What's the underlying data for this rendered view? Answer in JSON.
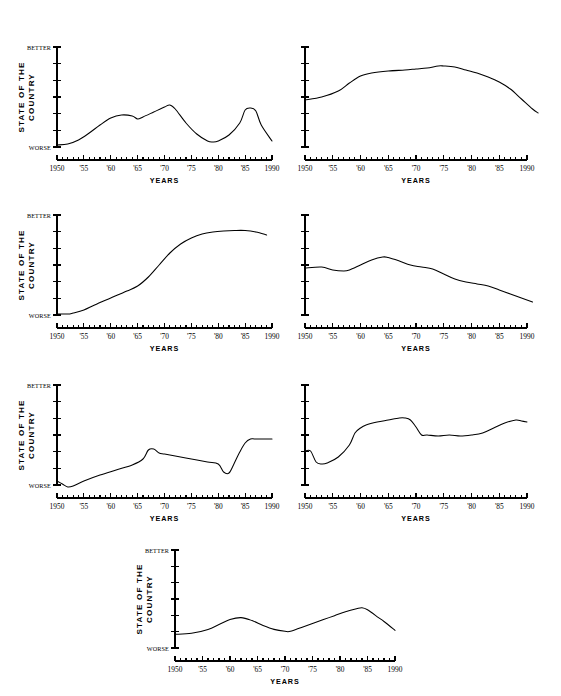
{
  "figure": {
    "background": "#ffffff",
    "ink": "#000000",
    "panel_count": 7
  },
  "axis_defaults": {
    "y_top_label": "BETTER",
    "y_bottom_label": "WORSE",
    "y_title_line1": "STATE OF THE",
    "y_title_line2": "COUNTRY",
    "x_title": "YEARS",
    "x_tick_labels": [
      "1950",
      "'55",
      "'60",
      "'65",
      "'70",
      "'75",
      "'80",
      "'85",
      "1990"
    ],
    "x_tick_values": [
      1950,
      1955,
      1960,
      1965,
      1970,
      1975,
      1980,
      1985,
      1990
    ],
    "x_minor_step": 1,
    "y_tick_count": 7
  },
  "chart_data": [
    {
      "id": "panel-1",
      "type": "line",
      "title": "",
      "xlabel": "YEARS",
      "ylabel": "STATE OF THE COUNTRY",
      "xlim": [
        1950,
        1990
      ],
      "ylim": [
        0,
        1
      ],
      "y_axis_labels": [
        "WORSE",
        "BETTER"
      ],
      "show_y_text": true,
      "grid": false,
      "legend": "none",
      "x": [
        1950,
        1952,
        1954,
        1956,
        1958,
        1960,
        1962,
        1964,
        1965,
        1966,
        1968,
        1970,
        1971,
        1972,
        1974,
        1976,
        1978,
        1979,
        1980,
        1982,
        1984,
        1985,
        1986,
        1987,
        1988,
        1990
      ],
      "y": [
        0.02,
        0.03,
        0.07,
        0.14,
        0.22,
        0.29,
        0.32,
        0.31,
        0.28,
        0.3,
        0.35,
        0.4,
        0.42,
        0.38,
        0.24,
        0.13,
        0.06,
        0.05,
        0.06,
        0.12,
        0.24,
        0.37,
        0.39,
        0.36,
        0.22,
        0.06
      ]
    },
    {
      "id": "panel-2",
      "type": "line",
      "title": "",
      "xlabel": "YEARS",
      "ylabel": "",
      "xlim": [
        1950,
        1992
      ],
      "ylim": [
        0,
        1
      ],
      "y_axis_labels": [],
      "show_y_text": false,
      "grid": false,
      "legend": "none",
      "x": [
        1950,
        1953,
        1956,
        1958,
        1960,
        1962,
        1965,
        1968,
        1970,
        1972,
        1974,
        1975,
        1977,
        1979,
        1981,
        1983,
        1985,
        1987,
        1989,
        1991,
        1992
      ],
      "y": [
        0.47,
        0.5,
        0.56,
        0.64,
        0.71,
        0.74,
        0.76,
        0.77,
        0.78,
        0.79,
        0.81,
        0.81,
        0.8,
        0.77,
        0.74,
        0.7,
        0.65,
        0.58,
        0.48,
        0.38,
        0.34
      ]
    },
    {
      "id": "panel-3",
      "type": "line",
      "title": "",
      "xlabel": "YEARS",
      "ylabel": "STATE OF THE COUNTRY",
      "xlim": [
        1950,
        1989
      ],
      "ylim": [
        0,
        1
      ],
      "y_axis_labels": [
        "WORSE",
        "BETTER"
      ],
      "show_y_text": true,
      "grid": false,
      "legend": "none",
      "x": [
        1950,
        1952,
        1953,
        1955,
        1957,
        1960,
        1963,
        1965,
        1967,
        1969,
        1971,
        1973,
        1975,
        1977,
        1979,
        1981,
        1983,
        1985,
        1987,
        1989
      ],
      "y": [
        0.01,
        0.01,
        0.02,
        0.05,
        0.1,
        0.17,
        0.24,
        0.29,
        0.38,
        0.5,
        0.62,
        0.71,
        0.77,
        0.81,
        0.83,
        0.84,
        0.845,
        0.845,
        0.83,
        0.8
      ]
    },
    {
      "id": "panel-4",
      "type": "line",
      "title": "",
      "xlabel": "YEARS",
      "ylabel": "",
      "xlim": [
        1950,
        1991
      ],
      "ylim": [
        0,
        1
      ],
      "y_axis_labels": [],
      "show_y_text": false,
      "grid": false,
      "legend": "none",
      "x": [
        1950,
        1953,
        1955,
        1957,
        1958,
        1960,
        1962,
        1964,
        1965,
        1967,
        1969,
        1971,
        1973,
        1975,
        1977,
        1979,
        1981,
        1983,
        1985,
        1987,
        1989,
        1991
      ],
      "y": [
        0.47,
        0.48,
        0.45,
        0.44,
        0.45,
        0.5,
        0.55,
        0.58,
        0.575,
        0.54,
        0.5,
        0.48,
        0.46,
        0.41,
        0.36,
        0.33,
        0.31,
        0.29,
        0.25,
        0.21,
        0.17,
        0.13
      ]
    },
    {
      "id": "panel-5",
      "type": "line",
      "title": "",
      "xlabel": "YEARS",
      "ylabel": "STATE OF THE COUNTRY",
      "xlim": [
        1950,
        1990
      ],
      "ylim": [
        0,
        1
      ],
      "y_axis_labels": [
        "WORSE",
        "BETTER"
      ],
      "show_y_text": true,
      "grid": false,
      "legend": "none",
      "x": [
        1950,
        1951,
        1952,
        1953,
        1955,
        1958,
        1961,
        1964,
        1966,
        1967,
        1968,
        1969,
        1970,
        1972,
        1975,
        1978,
        1980,
        1981,
        1982,
        1983,
        1984,
        1985,
        1986,
        1987,
        1990
      ],
      "y": [
        0.04,
        0.01,
        -0.02,
        -0.01,
        0.04,
        0.1,
        0.15,
        0.2,
        0.26,
        0.35,
        0.36,
        0.32,
        0.31,
        0.29,
        0.26,
        0.23,
        0.21,
        0.13,
        0.12,
        0.22,
        0.33,
        0.42,
        0.46,
        0.46,
        0.46
      ]
    },
    {
      "id": "panel-6",
      "type": "line",
      "title": "",
      "xlabel": "YEARS",
      "ylabel": "",
      "xlim": [
        1950,
        1990
      ],
      "ylim": [
        0,
        1
      ],
      "y_axis_labels": [],
      "show_y_text": false,
      "grid": false,
      "legend": "none",
      "x": [
        1950,
        1951,
        1952,
        1953,
        1954,
        1956,
        1958,
        1959,
        1960,
        1961,
        1963,
        1965,
        1967,
        1968,
        1969,
        1970,
        1971,
        1972,
        1974,
        1976,
        1978,
        1980,
        1982,
        1984,
        1986,
        1988,
        1989,
        1990
      ],
      "y": [
        0.34,
        0.34,
        0.23,
        0.21,
        0.22,
        0.28,
        0.4,
        0.52,
        0.57,
        0.6,
        0.63,
        0.65,
        0.67,
        0.67,
        0.65,
        0.58,
        0.5,
        0.5,
        0.49,
        0.5,
        0.49,
        0.5,
        0.52,
        0.57,
        0.62,
        0.65,
        0.64,
        0.63
      ]
    },
    {
      "id": "panel-7",
      "type": "line",
      "title": "",
      "xlabel": "YEARS",
      "ylabel": "STATE OF THE COUNTRY",
      "xlim": [
        1950,
        1990
      ],
      "ylim": [
        0,
        1
      ],
      "y_axis_labels": [
        "WORSE",
        "BETTER"
      ],
      "show_y_text": true,
      "grid": false,
      "legend": "none",
      "x": [
        1950,
        1953,
        1956,
        1958,
        1960,
        1962,
        1964,
        1966,
        1968,
        1970,
        1971,
        1973,
        1975,
        1977,
        1979,
        1981,
        1983,
        1984,
        1985,
        1987,
        1988,
        1990
      ],
      "y": [
        0.14,
        0.15,
        0.19,
        0.24,
        0.29,
        0.31,
        0.28,
        0.23,
        0.19,
        0.17,
        0.17,
        0.21,
        0.25,
        0.29,
        0.33,
        0.37,
        0.4,
        0.41,
        0.39,
        0.31,
        0.27,
        0.18
      ]
    }
  ]
}
